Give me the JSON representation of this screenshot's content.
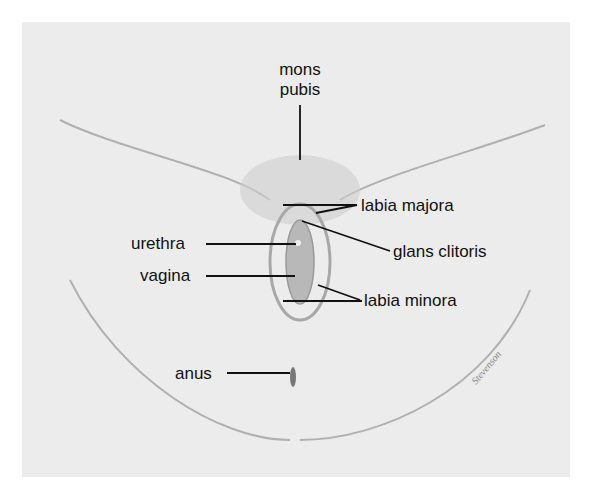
{
  "diagram": {
    "type": "anatomical-labeled-illustration",
    "style": "pencil schematic, grayscale",
    "colors": {
      "background": "#ececec",
      "line": "#111111",
      "shading": "#b8b8b8"
    },
    "labels": {
      "mons_pubis_line1": "mons",
      "mons_pubis_line2": "pubis",
      "labia_majora": "labia majora",
      "glans_clitoris": "glans clitoris",
      "urethra": "urethra",
      "vagina": "vagina",
      "labia_minora": "labia minora",
      "anus": "anus"
    },
    "signature": "Stevenson"
  }
}
